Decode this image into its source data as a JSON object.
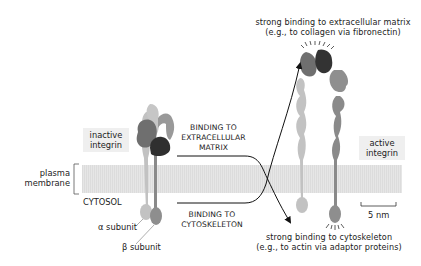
{
  "figure": {
    "top_caption": {
      "line1": "strong binding to extracellular matrix",
      "line2": "(e.g., to collagen via fibronectin)"
    },
    "bottom_caption": {
      "line1": "strong binding to cytoskeleton",
      "line2": "(e.g., to actin via adaptor proteins)"
    },
    "inactive_label": {
      "line1": "inactive",
      "line2": "integrin"
    },
    "active_label": {
      "line1": "active",
      "line2": "integrin"
    },
    "membrane_label": {
      "line1": "plasma",
      "line2": "membrane"
    },
    "cytosol_label": "CYTOSOL",
    "alpha_label": "α subunit",
    "beta_label": "β subunit",
    "binding_ecm": {
      "line1": "BINDING TO",
      "line2": "EXTRACELLULAR",
      "line3": "MATRIX"
    },
    "binding_cyto": {
      "line1": "BINDING TO",
      "line2": "CYTOSKELETON"
    },
    "scale_bar": "5 nm"
  },
  "colors": {
    "membrane": "#e4e4e4",
    "alpha_light": "#bdbdbd",
    "beta_mid": "#8a8a8a",
    "head_dark": "#3a3a3a",
    "head_mid": "#6e6e6e",
    "label_bg": "#efefef"
  }
}
